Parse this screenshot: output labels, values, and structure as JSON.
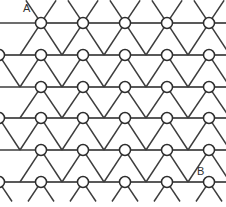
{
  "figure": {
    "kind": "triangular-lattice-diagram",
    "width": 226,
    "height": 207,
    "background_color": "#ffffff",
    "line_color": "#3c3c3c",
    "node_fill_color": "#ffffff",
    "node_stroke_color": "#2e2e2e",
    "label_color": "#303030"
  },
  "labels": {
    "point_a": "A",
    "point_b": "B"
  },
  "caption": {
    "text": ""
  },
  "chart_data": {
    "type": "scatter",
    "title": "",
    "xlabel": "",
    "ylabel": "",
    "grid": true,
    "legend": "none",
    "xlim": [
      0,
      226
    ],
    "ylim": [
      0,
      207
    ],
    "lattice": {
      "row_spacing": 31.5,
      "column_spacing": 42,
      "node_radius": 5.5,
      "row_count": 6,
      "row_y": [
        23,
        55,
        87,
        118,
        150,
        182
      ],
      "row_offsets": [
        41,
        -1,
        41,
        -1,
        41,
        -1
      ],
      "nodes_per_row": [
        5,
        6,
        5,
        6,
        5,
        6
      ],
      "bond_overhang": 16
    },
    "annotations": [
      {
        "text": "A",
        "x": 28,
        "y": 9,
        "target_node": {
          "row": 0,
          "col": 0
        }
      },
      {
        "text": "B",
        "x": 201,
        "y": 172,
        "target_node": {
          "row": 5,
          "col": 4
        }
      }
    ]
  }
}
